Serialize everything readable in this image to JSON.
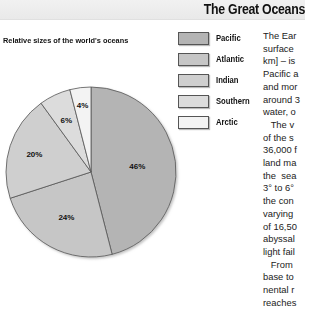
{
  "header": {
    "title": "The Great Oceans"
  },
  "chart_data": {
    "type": "pie",
    "title": "Relative sizes of the world's oceans",
    "categories": [
      "Pacific",
      "Atlantic",
      "Indian",
      "Southern",
      "Arctic"
    ],
    "values": [
      46,
      24,
      20,
      6,
      4
    ],
    "value_labels": [
      "46%",
      "24%",
      "20%",
      "6%",
      "4%"
    ],
    "colors": [
      "#b4b4b4",
      "#c6c6c6",
      "#cfcfcf",
      "#dcdcdc",
      "#f3f3f3"
    ],
    "start_angle": "12 o'clock",
    "direction": "clockwise",
    "legend_position": "right",
    "xlabel": "",
    "ylabel": ""
  },
  "legend": {
    "items": [
      {
        "label": "Pacific",
        "color": "#b4b4b4"
      },
      {
        "label": "Atlantic",
        "color": "#c6c6c6"
      },
      {
        "label": "Indian",
        "color": "#cfcfcf"
      },
      {
        "label": "Southern",
        "color": "#dcdcdc"
      },
      {
        "label": "Arctic",
        "color": "#f3f3f3"
      }
    ]
  },
  "body_text": {
    "lines": [
      "The Ear",
      "surface",
      "km] – is",
      "Pacific a",
      "and mor",
      "around 3",
      "water, o",
      "   The v",
      "of the s",
      "36,000 f",
      "land ma",
      "the  sea",
      "3° to 6°",
      "the con",
      "varying",
      "of 16,50",
      "abyssal",
      "light fail",
      "   From",
      "base to",
      "nental r",
      "reaches"
    ]
  }
}
